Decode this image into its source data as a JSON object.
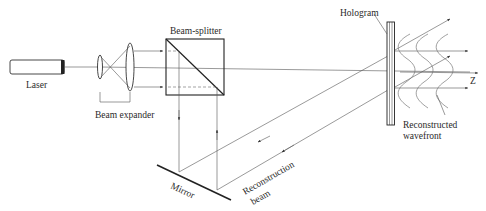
{
  "diagram": {
    "type": "optical-setup",
    "labels": {
      "laser": "Laser",
      "beam_expander": "Beam expander",
      "beam_splitter": "Beam-splitter",
      "mirror": "Mirror",
      "reconstruction_beam_line1": "Reconstruction",
      "reconstruction_beam_line2": "beam",
      "hologram": "Hologram",
      "reconstructed_wavefront_line1": "Reconstructed",
      "reconstructed_wavefront_line2": "wavefront",
      "axis": "Z"
    },
    "components": [
      {
        "name": "Laser"
      },
      {
        "name": "Beam expander",
        "parts": [
          "small lens",
          "large lens"
        ]
      },
      {
        "name": "Beam-splitter"
      },
      {
        "name": "Mirror"
      },
      {
        "name": "Hologram"
      }
    ],
    "colors": {
      "line": "#555555",
      "text": "#2a2a2a",
      "background": "#ffffff"
    }
  }
}
